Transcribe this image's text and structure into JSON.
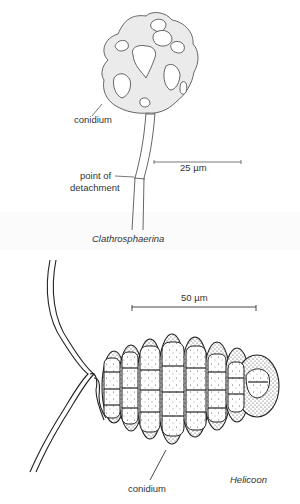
{
  "figure": {
    "panels": [
      {
        "id": "top",
        "genus": "Clathrosphaerina",
        "labels": {
          "conidium": "conidium",
          "detachment": "point of\ndetachment",
          "detachment_line1": "point of",
          "detachment_line2": "detachment",
          "scale_bar": "25 µm"
        },
        "scale_bar_value_um": 25
      },
      {
        "id": "bottom",
        "genus": "Helicoon",
        "labels": {
          "conidium": "conidium",
          "scale_bar": "50 µm"
        },
        "scale_bar_value_um": 50
      }
    ],
    "colors": {
      "ink": "#333333",
      "conidium_fill": "#e9e9e9",
      "background": "#ffffff"
    }
  }
}
